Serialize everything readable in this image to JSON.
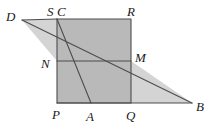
{
  "figure": {
    "canvas": {
      "width": 214,
      "height": 127
    },
    "colors": {
      "background": "#ffffff",
      "square_fill": "#b9b9b9",
      "left_triangle_fill": "#d4d4d4",
      "right_triangle_fill": "#d4d4d4",
      "stroke": "#4d4d4d",
      "label_color": "#1a1a1a"
    },
    "points": {
      "D": {
        "x": 22,
        "y": 20,
        "label": "D",
        "label_x": 6,
        "label_y": 21
      },
      "S": {
        "x": 57,
        "y": 19,
        "label": "S",
        "label_x": 47,
        "label_y": 16
      },
      "C": {
        "x": 57,
        "y": 19,
        "label": "C",
        "label_x": 57,
        "label_y": 16
      },
      "R": {
        "x": 131,
        "y": 19,
        "label": "R",
        "label_x": 128,
        "label_y": 16
      },
      "N": {
        "x": 57,
        "y": 61,
        "label": "N",
        "label_x": 42,
        "label_y": 67
      },
      "M": {
        "x": 131,
        "y": 61,
        "label": "M",
        "label_x": 135,
        "label_y": 61
      },
      "P": {
        "x": 57,
        "y": 103,
        "label": "P",
        "label_x": 52,
        "label_y": 118
      },
      "A": {
        "x": 91,
        "y": 103,
        "label": "A",
        "label_x": 86,
        "label_y": 119
      },
      "Q": {
        "x": 131,
        "y": 103,
        "label": "Q",
        "label_x": 126,
        "label_y": 119
      },
      "B": {
        "x": 192,
        "y": 103,
        "label": "B",
        "label_x": 196,
        "label_y": 110
      }
    },
    "shapes": {
      "square": {
        "name": "square-PQRC",
        "path": "M 57 19 L 131 19 L 131 103 L 57 103 Z"
      },
      "left_triangle": {
        "name": "triangle-DCN",
        "path": "M 22 20 L 57 19 L 57 61 Z"
      },
      "right_triangle": {
        "name": "triangle-MQB",
        "path": "M 131 61 L 192 103 L 131 103 Z"
      }
    },
    "segments": [
      {
        "name": "segment-D-B",
        "x1": 22,
        "y1": 20,
        "x2": 192,
        "y2": 103
      },
      {
        "name": "segment-C-A",
        "x1": 57,
        "y1": 19,
        "x2": 91,
        "y2": 103
      },
      {
        "name": "segment-N-M",
        "x1": 57,
        "y1": 61,
        "x2": 131,
        "y2": 61
      },
      {
        "name": "segment-P-B",
        "x1": 57,
        "y1": 103,
        "x2": 192,
        "y2": 103
      },
      {
        "name": "segment-D-C",
        "x1": 22,
        "y1": 20,
        "x2": 57,
        "y2": 19
      }
    ],
    "labels": [
      "D",
      "S",
      "C",
      "R",
      "N",
      "M",
      "P",
      "A",
      "Q",
      "B"
    ]
  }
}
